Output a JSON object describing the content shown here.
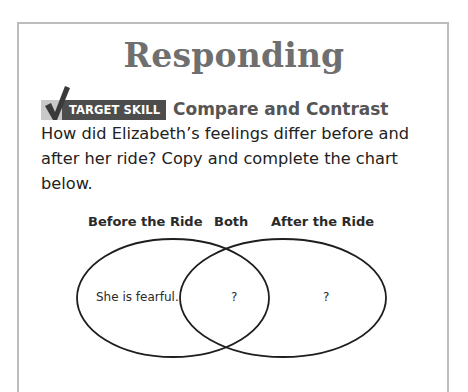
{
  "page": {
    "title": "Responding",
    "badge_label": "TARGET SKILL",
    "skill_title": "Compare and Contrast",
    "prompt_lines": [
      "How did Elizabeth’s feelings differ before and",
      "after her ride? Copy and complete the chart",
      "below."
    ],
    "icons": {
      "badge_icon": "checkmark-icon"
    },
    "colors": {
      "title": "#6f6f6f",
      "badge_bg": "#4d4d4d",
      "badge_stripe": "#c9c9c9",
      "checkmark": "#3a3a3a",
      "border": "#bdbdbd"
    }
  },
  "venn": {
    "labels": {
      "left": "Before the Ride",
      "middle": "Both",
      "right": "After the Ride"
    },
    "regions": {
      "left": "She is fearful.",
      "middle": "?",
      "right": "?"
    }
  }
}
